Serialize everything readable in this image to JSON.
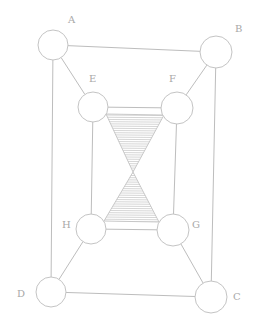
{
  "diagram": {
    "type": "graph",
    "colors": {
      "line": "#bdbdbd",
      "node_stroke": "#c4c4c4",
      "label": "#a8a8a8",
      "hatch": "#b8b8b8"
    },
    "nodes": [
      {
        "id": "A",
        "label": "A",
        "cx": 53,
        "cy": 45,
        "r": 15,
        "lx": 68,
        "ly": 23
      },
      {
        "id": "B",
        "label": "B",
        "cx": 216,
        "cy": 52,
        "r": 16,
        "lx": 235,
        "ly": 32
      },
      {
        "id": "E",
        "label": "E",
        "cx": 93,
        "cy": 107,
        "r": 15,
        "lx": 89,
        "ly": 82
      },
      {
        "id": "F",
        "label": "F",
        "cx": 177,
        "cy": 108,
        "r": 16,
        "lx": 169,
        "ly": 82
      },
      {
        "id": "H",
        "label": "H",
        "cx": 91,
        "cy": 229,
        "r": 15,
        "lx": 62,
        "ly": 228
      },
      {
        "id": "G",
        "label": "G",
        "cx": 173,
        "cy": 230,
        "r": 16,
        "lx": 192,
        "ly": 228
      },
      {
        "id": "D",
        "label": "D",
        "cx": 51,
        "cy": 292,
        "r": 15,
        "lx": 17,
        "ly": 297
      },
      {
        "id": "C",
        "label": "C",
        "cx": 211,
        "cy": 297,
        "r": 16,
        "lx": 233,
        "ly": 300
      }
    ],
    "edges": [
      {
        "from": "A",
        "to": "B"
      },
      {
        "from": "A",
        "to": "D"
      },
      {
        "from": "B",
        "to": "C"
      },
      {
        "from": "D",
        "to": "C"
      },
      {
        "from": "A",
        "to": "E"
      },
      {
        "from": "B",
        "to": "F"
      },
      {
        "from": "H",
        "to": "D"
      },
      {
        "from": "G",
        "to": "C"
      },
      {
        "from": "E",
        "to": "H"
      },
      {
        "from": "F",
        "to": "G"
      },
      {
        "from": "E",
        "to": "F"
      },
      {
        "from": "H",
        "to": "G"
      }
    ],
    "shaded_regions": [
      {
        "name": "upper-triangle",
        "points": [
          [
            106,
            114
          ],
          [
            164,
            115
          ],
          [
            133,
            172
          ]
        ]
      },
      {
        "name": "lower-triangle",
        "points": [
          [
            133,
            172
          ],
          [
            104,
            221
          ],
          [
            159,
            222
          ]
        ]
      }
    ]
  }
}
